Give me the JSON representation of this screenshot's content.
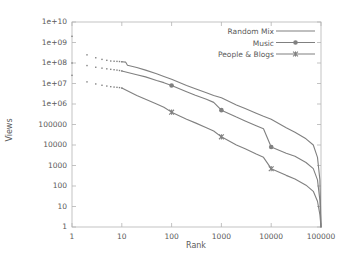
{
  "chart_data": {
    "type": "line",
    "title": "",
    "xlabel": "Rank",
    "ylabel": "Views",
    "xscale": "log",
    "yscale": "log",
    "xlim": [
      1,
      100000
    ],
    "ylim": [
      1,
      10000000000
    ],
    "grid": false,
    "legend_position": "top-right",
    "xtick_labels": [
      "1",
      "10",
      "100",
      "1000",
      "10000",
      "100000"
    ],
    "xtick_values": [
      1,
      10,
      100,
      1000,
      10000,
      100000
    ],
    "ytick_labels": [
      "1",
      "10",
      "100",
      "1000",
      "10000",
      "100000",
      "1e+06",
      "1e+07",
      "1e+08",
      "1e+09",
      "1e+10"
    ],
    "ytick_values": [
      1,
      10,
      100,
      1000,
      10000,
      100000,
      1000000,
      10000000,
      100000000,
      1000000000,
      10000000000
    ],
    "series": [
      {
        "name": "Random Mix",
        "marker": "none",
        "color": "#808080",
        "x": [
          1,
          2,
          3,
          4,
          5,
          6,
          7,
          8,
          9,
          10,
          12,
          13,
          20,
          30,
          50,
          70,
          100,
          200,
          300,
          500,
          700,
          1000,
          2000,
          3000,
          5000,
          7000,
          10000,
          20000,
          30000,
          50000,
          70000,
          85000,
          95000,
          100000
        ],
        "y": [
          2000000000,
          250000000,
          180000000,
          150000000,
          135000000,
          125000000,
          122000000,
          120000000,
          118000000,
          115000000,
          110000000,
          78000000,
          60000000,
          45000000,
          30000000,
          22000000,
          16000000,
          8000000,
          5500000,
          3500000,
          2600000,
          2000000,
          900000,
          600000,
          350000,
          250000,
          180000,
          70000,
          42000,
          20000,
          10000,
          2500,
          200,
          1
        ]
      },
      {
        "name": "Music",
        "marker": "circle",
        "color": "#808080",
        "marker_x": [
          1,
          100,
          1000,
          10000,
          100000
        ],
        "marker_y": [
          100000000,
          8000000,
          500000,
          8000,
          1
        ],
        "x": [
          1,
          2,
          3,
          4,
          5,
          6,
          7,
          8,
          9,
          10,
          20,
          30,
          50,
          70,
          100,
          200,
          300,
          500,
          700,
          1000,
          2000,
          3000,
          5000,
          7000,
          10000,
          20000,
          30000,
          50000,
          70000,
          85000,
          95000,
          100000
        ],
        "y": [
          100000000,
          75000000,
          62000000,
          56000000,
          52000000,
          49000000,
          47000000,
          45000000,
          43000000,
          41000000,
          27000000,
          21000000,
          14000000,
          11000000,
          8000000,
          4000000,
          2700000,
          1700000,
          1200000,
          500000,
          230000,
          150000,
          88000,
          62000,
          8000,
          4000,
          2800,
          1400,
          700,
          200,
          20,
          1
        ]
      },
      {
        "name": "People & Blogs",
        "marker": "x",
        "color": "#808080",
        "marker_x": [
          1,
          100,
          1000,
          10000,
          100000
        ],
        "marker_y": [
          25000000,
          400000,
          25000,
          700,
          1
        ],
        "x": [
          1,
          2,
          3,
          4,
          5,
          6,
          7,
          8,
          9,
          10,
          20,
          30,
          50,
          70,
          100,
          200,
          300,
          500,
          700,
          1000,
          2000,
          3000,
          5000,
          7000,
          10000,
          20000,
          30000,
          50000,
          70000,
          85000,
          95000,
          100000
        ],
        "y": [
          25000000,
          12000000,
          9500000,
          8200000,
          7500000,
          7000000,
          6700000,
          6500000,
          6300000,
          6000000,
          2600000,
          1700000,
          1000000,
          700000,
          400000,
          180000,
          120000,
          70000,
          48000,
          25000,
          10000,
          6500,
          3600,
          2500,
          700,
          330,
          220,
          110,
          55,
          18,
          4,
          1
        ]
      }
    ]
  },
  "legend": {
    "entries": [
      {
        "label": "Random Mix",
        "marker": "none"
      },
      {
        "label": "Music",
        "marker": "circle"
      },
      {
        "label": "People & Blogs",
        "marker": "x"
      }
    ]
  },
  "axes": {
    "x_title": "Rank",
    "y_title": "Views"
  },
  "colors": {
    "line": "#808080",
    "axis": "#b4b4b4",
    "text": "#5a5a5a",
    "background": "#ffffff"
  }
}
